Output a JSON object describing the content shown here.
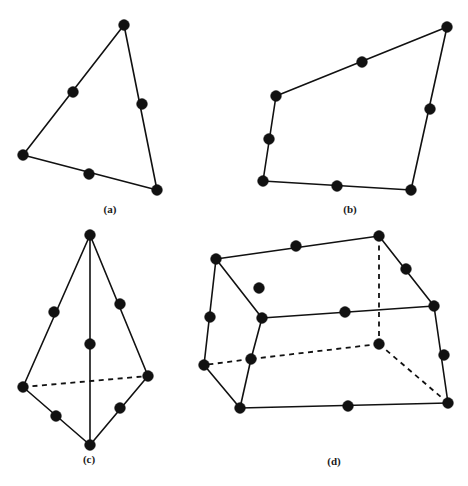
{
  "figure": {
    "background_color": "#ffffff",
    "ink_color": "#111111",
    "width": 468,
    "height": 486
  },
  "panels": [
    {
      "id": "a",
      "label": "(a)",
      "label_x": 110,
      "label_y": 203,
      "element_type": "6-node quadratic triangle",
      "corner_nodes": [
        {
          "name": "apex",
          "x": 124,
          "y": 25
        },
        {
          "name": "left",
          "x": 23,
          "y": 155
        },
        {
          "name": "bottom-right",
          "x": 157,
          "y": 190
        }
      ],
      "mid_nodes": [
        {
          "name": "mid-left-edge",
          "x": 73,
          "y": 92
        },
        {
          "name": "mid-right-edge",
          "x": 142,
          "y": 104
        },
        {
          "name": "mid-bottom-edge",
          "x": 89,
          "y": 174
        }
      ],
      "solid_edges": [
        [
          124,
          25,
          23,
          155
        ],
        [
          23,
          155,
          157,
          190
        ],
        [
          157,
          190,
          124,
          25
        ]
      ],
      "dashed_edges": []
    },
    {
      "id": "b",
      "label": "(b)",
      "label_x": 350,
      "label_y": 203,
      "element_type": "8-node quadratic quadrilateral",
      "corner_nodes": [
        {
          "name": "top-left",
          "x": 276,
          "y": 96
        },
        {
          "name": "top-right",
          "x": 447,
          "y": 27
        },
        {
          "name": "bottom-right",
          "x": 411,
          "y": 190
        },
        {
          "name": "bottom-left",
          "x": 263,
          "y": 181
        }
      ],
      "mid_nodes": [
        {
          "name": "mid-top-edge",
          "x": 362,
          "y": 62
        },
        {
          "name": "mid-right-edge",
          "x": 430,
          "y": 109
        },
        {
          "name": "mid-bottom-edge",
          "x": 337,
          "y": 186
        },
        {
          "name": "mid-left-edge",
          "x": 269,
          "y": 139
        }
      ],
      "solid_edges": [
        [
          276,
          96,
          447,
          27
        ],
        [
          447,
          27,
          411,
          190
        ],
        [
          411,
          190,
          263,
          181
        ],
        [
          263,
          181,
          276,
          96
        ]
      ],
      "dashed_edges": []
    },
    {
      "id": "c",
      "label": "(c)",
      "label_x": 89,
      "label_y": 453,
      "element_type": "10-node quadratic tetrahedron",
      "corner_nodes": [
        {
          "name": "apex-top",
          "x": 90,
          "y": 235
        },
        {
          "name": "left",
          "x": 23,
          "y": 387
        },
        {
          "name": "right",
          "x": 148,
          "y": 376
        },
        {
          "name": "bottom",
          "x": 90,
          "y": 445
        }
      ],
      "mid_nodes": [
        {
          "name": "mid-apex-left",
          "x": 54,
          "y": 312
        },
        {
          "name": "mid-apex-right",
          "x": 120,
          "y": 304
        },
        {
          "name": "mid-apex-bottom",
          "x": 90,
          "y": 344
        },
        {
          "name": "mid-left-bottom",
          "x": 56,
          "y": 416
        },
        {
          "name": "mid-right-bottom",
          "x": 120,
          "y": 408
        }
      ],
      "solid_edges": [
        [
          90,
          235,
          23,
          387
        ],
        [
          90,
          235,
          148,
          376
        ],
        [
          90,
          235,
          90,
          445
        ],
        [
          23,
          387,
          90,
          445
        ],
        [
          148,
          376,
          90,
          445
        ]
      ],
      "dashed_edges": [
        [
          23,
          387,
          148,
          376
        ]
      ]
    },
    {
      "id": "d",
      "label": "(d)",
      "label_x": 334,
      "label_y": 455,
      "element_type": "20-node quadratic hexahedron",
      "corner_nodes": [
        {
          "name": "top-back-left",
          "x": 216,
          "y": 259
        },
        {
          "name": "top-back-right",
          "x": 379,
          "y": 236
        },
        {
          "name": "top-front-left",
          "x": 262,
          "y": 318
        },
        {
          "name": "top-front-right",
          "x": 434,
          "y": 306
        },
        {
          "name": "bottom-back-left",
          "x": 204,
          "y": 365
        },
        {
          "name": "bottom-back-right-hidden",
          "x": 379,
          "y": 344
        },
        {
          "name": "bottom-front-left",
          "x": 240,
          "y": 408
        },
        {
          "name": "bottom-front-right",
          "x": 448,
          "y": 403
        },
        {
          "name": "hidden-mid-left",
          "x": 251,
          "y": 359
        }
      ],
      "mid_nodes": [
        {
          "name": "mid-top-back",
          "x": 296,
          "y": 246
        },
        {
          "name": "mid-top-right-back",
          "x": 406,
          "y": 269
        },
        {
          "name": "mid-top-front",
          "x": 345,
          "y": 312
        },
        {
          "name": "mid-top-left-diag",
          "x": 259,
          "y": 288
        },
        {
          "name": "mid-left-vertical",
          "x": 210,
          "y": 317
        },
        {
          "name": "mid-right-vertical",
          "x": 444,
          "y": 355
        },
        {
          "name": "mid-bottom-front",
          "x": 348,
          "y": 406
        }
      ],
      "solid_edges": [
        [
          216,
          259,
          379,
          236
        ],
        [
          379,
          236,
          434,
          306
        ],
        [
          434,
          306,
          262,
          318
        ],
        [
          262,
          318,
          216,
          259
        ],
        [
          216,
          259,
          204,
          365
        ],
        [
          204,
          365,
          240,
          408
        ],
        [
          262,
          318,
          251,
          359
        ],
        [
          251,
          359,
          240,
          408
        ],
        [
          240,
          408,
          448,
          403
        ],
        [
          448,
          403,
          434,
          306
        ]
      ],
      "dashed_edges": [
        [
          379,
          236,
          379,
          344
        ],
        [
          379,
          344,
          251,
          359
        ],
        [
          251,
          359,
          204,
          365
        ],
        [
          379,
          344,
          448,
          403
        ]
      ]
    }
  ]
}
